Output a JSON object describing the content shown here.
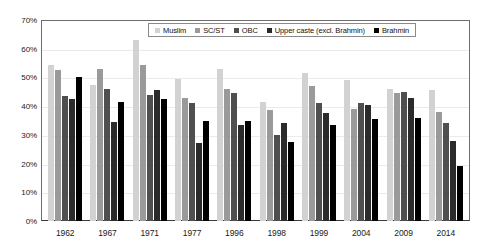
{
  "chart_data": {
    "type": "bar",
    "title": "",
    "subtitle": "",
    "xlabel": "",
    "ylabel": "",
    "ylim": [
      0,
      70
    ],
    "ytick_labels": [
      "70%",
      "60%",
      "50%",
      "40%",
      "30%",
      "20%",
      "10%",
      "0%"
    ],
    "ytick_values": [
      70,
      60,
      50,
      40,
      30,
      20,
      10,
      0
    ],
    "grid": true,
    "legend_position": "top-center",
    "categories": [
      "1962",
      "1967",
      "1971",
      "1977",
      "1996",
      "1998",
      "1999",
      "2004",
      "2009",
      "2014"
    ],
    "series": [
      {
        "name": "Muslim",
        "color": "#d2d2d2",
        "values": [
          54.5,
          47.5,
          63.0,
          49.5,
          53.0,
          41.5,
          51.5,
          49.0,
          46.0,
          45.5
        ]
      },
      {
        "name": "SC/ST",
        "color": "#9a9a9a",
        "values": [
          52.5,
          53.0,
          54.5,
          43.0,
          46.0,
          38.5,
          47.0,
          39.0,
          44.5,
          38.0
        ]
      },
      {
        "name": "OBC",
        "color": "#4f4f4f",
        "values": [
          43.5,
          46.0,
          44.0,
          41.0,
          44.5,
          30.0,
          41.0,
          41.0,
          45.0,
          34.0
        ]
      },
      {
        "name": "Upper caste (excl. Brahmin)",
        "color": "#2b2b2b",
        "values": [
          42.5,
          34.5,
          45.5,
          27.0,
          33.5,
          34.0,
          37.5,
          40.5,
          43.0,
          28.0
        ]
      },
      {
        "name": "Brahmin",
        "color": "#000000",
        "values": [
          50.0,
          41.5,
          42.5,
          35.0,
          35.0,
          27.5,
          33.5,
          35.5,
          36.0,
          19.0
        ]
      }
    ]
  }
}
